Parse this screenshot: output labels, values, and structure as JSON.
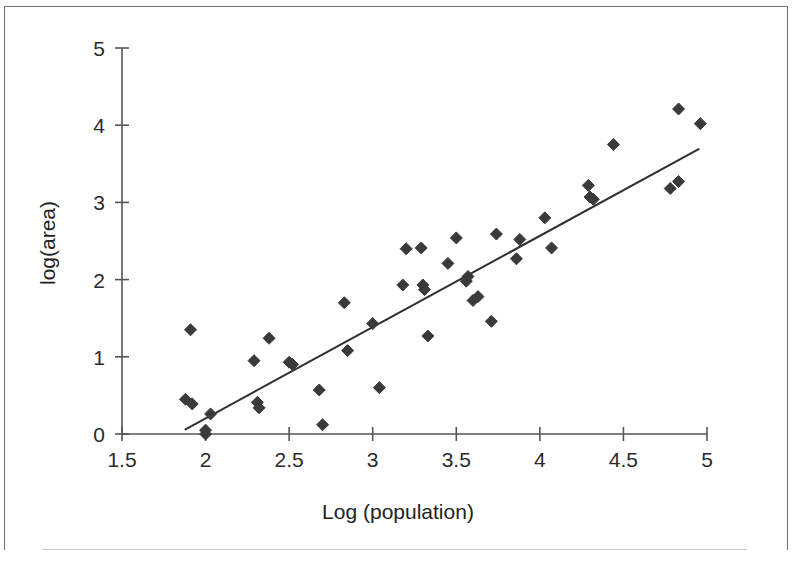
{
  "chart_data": {
    "type": "scatter",
    "title": "",
    "xlabel": "Log (population)",
    "ylabel": "log(area)",
    "xlim": [
      1.5,
      5.0
    ],
    "ylim": [
      0,
      5
    ],
    "xticks": [
      1.5,
      2,
      2.5,
      3,
      3.5,
      4,
      4.5,
      5
    ],
    "xticklabels": [
      "1.5",
      "2",
      "2.5",
      "3",
      "3.5",
      "4",
      "4.5",
      "5"
    ],
    "yticks": [
      0,
      1,
      2,
      3,
      4,
      5
    ],
    "yticklabels": [
      "0",
      "1",
      "2",
      "3",
      "4",
      "5"
    ],
    "grid": false,
    "legend": null,
    "marker": "diamond",
    "marker_color": "#3a3a3a",
    "marker_size": 11,
    "axis_color": "#555555",
    "series": [
      {
        "name": "observations",
        "points": [
          [
            1.88,
            0.45
          ],
          [
            1.92,
            0.39
          ],
          [
            1.91,
            1.35
          ],
          [
            2.0,
            0.05
          ],
          [
            2.0,
            0.0
          ],
          [
            2.03,
            0.26
          ],
          [
            2.29,
            0.95
          ],
          [
            2.31,
            0.41
          ],
          [
            2.32,
            0.34
          ],
          [
            2.38,
            1.24
          ],
          [
            2.5,
            0.93
          ],
          [
            2.52,
            0.9
          ],
          [
            2.68,
            0.57
          ],
          [
            2.7,
            0.12
          ],
          [
            2.83,
            1.7
          ],
          [
            2.85,
            1.08
          ],
          [
            3.0,
            1.43
          ],
          [
            3.04,
            0.6
          ],
          [
            3.18,
            1.93
          ],
          [
            3.2,
            2.4
          ],
          [
            3.29,
            2.41
          ],
          [
            3.3,
            1.93
          ],
          [
            3.31,
            1.87
          ],
          [
            3.33,
            1.27
          ],
          [
            3.45,
            2.21
          ],
          [
            3.5,
            2.54
          ],
          [
            3.56,
            1.98
          ],
          [
            3.57,
            2.04
          ],
          [
            3.6,
            1.73
          ],
          [
            3.63,
            1.78
          ],
          [
            3.71,
            1.46
          ],
          [
            3.74,
            2.59
          ],
          [
            3.86,
            2.27
          ],
          [
            3.88,
            2.52
          ],
          [
            4.03,
            2.8
          ],
          [
            4.07,
            2.41
          ],
          [
            4.29,
            3.22
          ],
          [
            4.3,
            3.07
          ],
          [
            4.32,
            3.04
          ],
          [
            4.44,
            3.75
          ],
          [
            4.78,
            3.18
          ],
          [
            4.83,
            3.27
          ],
          [
            4.83,
            4.21
          ],
          [
            4.96,
            4.02
          ]
        ]
      }
    ],
    "trendline": {
      "type": "linear",
      "x_start": 1.88,
      "y_start": 0.06,
      "x_end": 4.95,
      "y_end": 3.69,
      "color": "#2f2f2f",
      "width": 2
    }
  }
}
